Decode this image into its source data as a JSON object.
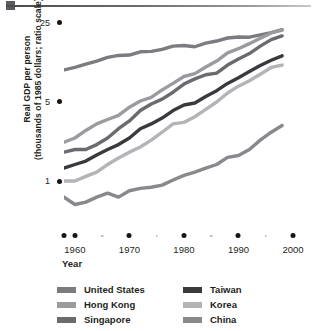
{
  "figure": {
    "top_rule": "decorative-rule"
  },
  "axes": {
    "ylabel_line1": "Real GDP per person",
    "ylabel_line2": "(thousands of 1985 dollars; ratio scale)",
    "xlabel": "Year",
    "yticks": [
      {
        "value": 25,
        "label": "25"
      },
      {
        "value": 5,
        "label": "5"
      },
      {
        "value": 1,
        "label": "1"
      }
    ],
    "xticks_major": [
      "1960",
      "1970",
      "1980",
      "1990",
      "2000"
    ],
    "xticks_minor": [
      "1965",
      "1975",
      "1985",
      "1995"
    ]
  },
  "legend": {
    "columns": [
      [
        {
          "name": "United States",
          "color": "#7b7b80"
        },
        {
          "name": "Hong Kong",
          "color": "#9a9a9f"
        },
        {
          "name": "Singapore",
          "color": "#6a6a6f"
        }
      ],
      [
        {
          "name": "Taiwan",
          "color": "#3a3a3e"
        },
        {
          "name": "Korea",
          "color": "#b4b4b8"
        },
        {
          "name": "China",
          "color": "#88888d"
        }
      ]
    ]
  },
  "chart_data": {
    "type": "line",
    "title": "",
    "xlabel": "Year",
    "ylabel": "Real GDP per person (thousands of 1985 dollars; ratio scale)",
    "yscale": "log",
    "ylim": [
      0.4,
      30
    ],
    "xlim": [
      1958,
      2000
    ],
    "ytick_values": [
      1,
      5,
      25
    ],
    "xtick_values": [
      1960,
      1970,
      1980,
      1990,
      2000
    ],
    "grid": false,
    "legend_position": "bottom",
    "x": [
      1958,
      1960,
      1962,
      1964,
      1966,
      1968,
      1970,
      1972,
      1974,
      1976,
      1978,
      1980,
      1982,
      1984,
      1986,
      1988,
      1990,
      1992,
      1994,
      1996,
      1998
    ],
    "series": [
      {
        "name": "United States",
        "color": "#7b7b80",
        "values": [
          9.6,
          10.1,
          10.8,
          11.5,
          12.4,
          12.9,
          13.0,
          13.9,
          14.0,
          14.6,
          15.6,
          15.8,
          15.4,
          16.6,
          17.3,
          18.4,
          18.8,
          18.7,
          19.6,
          20.5,
          21.8
        ]
      },
      {
        "name": "Hong Kong",
        "color": "#9a9a9f",
        "values": [
          2.2,
          2.4,
          2.8,
          3.2,
          3.5,
          3.8,
          4.5,
          5.1,
          5.5,
          6.4,
          7.3,
          8.4,
          8.9,
          10.2,
          11.5,
          13.6,
          14.8,
          16.4,
          18.3,
          20.4,
          21.6
        ]
      },
      {
        "name": "Singapore",
        "color": "#6a6a6f",
        "values": [
          1.8,
          1.9,
          1.9,
          2.1,
          2.4,
          2.9,
          3.4,
          4.2,
          4.8,
          5.3,
          6.1,
          7.2,
          8.0,
          8.7,
          9.0,
          10.6,
          12.0,
          13.4,
          15.6,
          17.8,
          19.2
        ]
      },
      {
        "name": "Taiwan",
        "color": "#3a3a3e",
        "values": [
          1.3,
          1.4,
          1.5,
          1.7,
          1.9,
          2.1,
          2.4,
          2.9,
          3.2,
          3.6,
          4.2,
          4.7,
          4.9,
          5.6,
          6.3,
          7.3,
          8.2,
          9.3,
          10.5,
          11.7,
          12.8
        ]
      },
      {
        "name": "Korea",
        "color": "#b4b4b8",
        "values": [
          1.0,
          1.0,
          1.1,
          1.2,
          1.4,
          1.6,
          1.8,
          2.0,
          2.3,
          2.7,
          3.2,
          3.3,
          3.7,
          4.3,
          5.0,
          6.0,
          6.9,
          7.7,
          8.8,
          10.1,
          10.6
        ]
      },
      {
        "name": "China",
        "color": "#88888d",
        "values": [
          0.72,
          0.62,
          0.65,
          0.72,
          0.78,
          0.72,
          0.82,
          0.86,
          0.88,
          0.92,
          1.02,
          1.12,
          1.2,
          1.3,
          1.4,
          1.62,
          1.68,
          1.9,
          2.3,
          2.7,
          3.1
        ]
      }
    ]
  }
}
